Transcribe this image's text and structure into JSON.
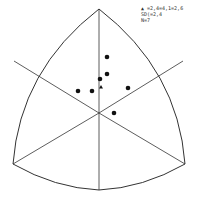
{
  "diagram": {
    "type": "stereographic-triangle-plot",
    "outline_color": "#333333",
    "point_color": "#111111",
    "center": [
      99,
      113
    ],
    "vertices": {
      "top": [
        99,
        9
      ],
      "bottom_left": [
        13,
        164
      ],
      "bottom_right": [
        185,
        164
      ],
      "bottom_mid": [
        99,
        190
      ]
    },
    "radial_lines": [
      {
        "from": [
          99,
          113
        ],
        "to": [
          99,
          9
        ]
      },
      {
        "from": [
          99,
          113
        ],
        "to": [
          99,
          190
        ]
      },
      {
        "from": [
          99,
          113
        ],
        "to": [
          13,
          164
        ]
      },
      {
        "from": [
          99,
          113
        ],
        "to": [
          185,
          164
        ]
      },
      {
        "from": [
          99,
          113
        ],
        "to": [
          14,
          61
        ]
      },
      {
        "from": [
          99,
          113
        ],
        "to": [
          183,
          61
        ]
      }
    ],
    "points": [
      {
        "x": 107,
        "y": 57
      },
      {
        "x": 107,
        "y": 74
      },
      {
        "x": 100,
        "y": 79
      },
      {
        "x": 78,
        "y": 91
      },
      {
        "x": 92,
        "y": 91
      },
      {
        "x": 128,
        "y": 88
      },
      {
        "x": 114,
        "y": 113
      }
    ],
    "mean_marker": {
      "x": 101,
      "y": 87,
      "shape": "triangle"
    }
  },
  "legend": {
    "line1": "▲ =2,4=4,1=2,6",
    "line2": "SD(=2,4",
    "line3": "N=7"
  }
}
